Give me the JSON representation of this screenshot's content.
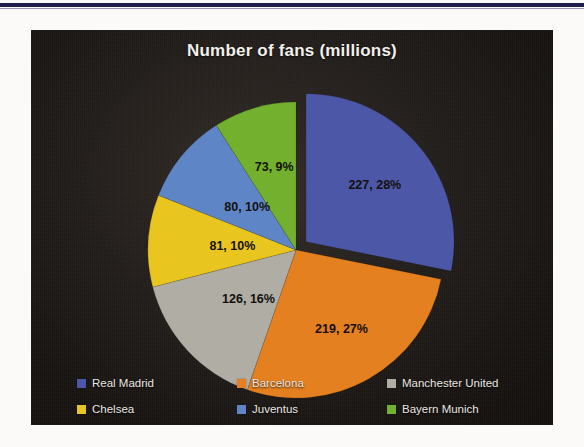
{
  "chart_data": {
    "type": "pie",
    "title": "Number of fans (millions)",
    "unit": "millions",
    "legend_position": "bottom",
    "exploded_slice": "Real Madrid",
    "categories": [
      "Real Madrid",
      "Barcelona",
      "Manchester United",
      "Chelsea",
      "Juventus",
      "Bayern Munich"
    ],
    "values": [
      227,
      219,
      126,
      81,
      80,
      73
    ],
    "percentages": [
      28,
      27,
      16,
      10,
      10,
      9
    ],
    "total": 806,
    "colors": [
      "#4d57a8",
      "#e4801f",
      "#afada4",
      "#e9c51f",
      "#5e85c6",
      "#72b02e"
    ],
    "slices": [
      {
        "label": "Real Madrid",
        "value": 227,
        "percent": 28,
        "data_label": "227, 28%",
        "color": "#4d57a8",
        "exploded": true
      },
      {
        "label": "Barcelona",
        "value": 219,
        "percent": 27,
        "data_label": "219, 27%",
        "color": "#e4801f",
        "exploded": false
      },
      {
        "label": "Manchester United",
        "value": 126,
        "percent": 16,
        "data_label": "126, 16%",
        "color": "#afada4",
        "exploded": false
      },
      {
        "label": "Chelsea",
        "value": 81,
        "percent": 10,
        "data_label": "81, 10%",
        "color": "#e9c51f",
        "exploded": false
      },
      {
        "label": "Juventus",
        "value": 80,
        "percent": 10,
        "data_label": "80, 10%",
        "color": "#5e85c6",
        "exploded": false
      },
      {
        "label": "Bayern Munich",
        "value": 73,
        "percent": 9,
        "data_label": "73, 9%",
        "color": "#72b02e",
        "exploded": false
      }
    ]
  },
  "legend": {
    "items": [
      {
        "label": "Real Madrid",
        "color": "#4d57a8"
      },
      {
        "label": "Barcelona",
        "color": "#e4801f"
      },
      {
        "label": "Manchester United",
        "color": "#afada4"
      },
      {
        "label": "Chelsea",
        "color": "#e9c51f"
      },
      {
        "label": "Juventus",
        "color": "#5e85c6"
      },
      {
        "label": "Bayern Munich",
        "color": "#72b02e"
      }
    ]
  }
}
